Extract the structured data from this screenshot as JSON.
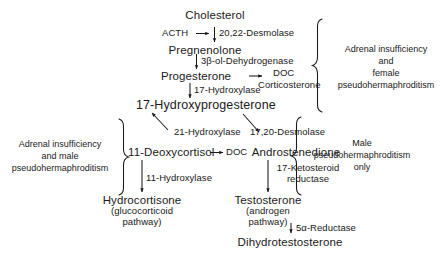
{
  "diagram": {
    "ink_color": "#1a1a1a",
    "background_color": "#ffffff"
  },
  "metabolites": {
    "cholesterol": "Cholesterol",
    "pregnenolone": "Pregnenolone",
    "progesterone": "Progesterone",
    "doc_upper": "DOC",
    "corticosterone": "Corticosterone",
    "hydroxyprogesterone": "17-Hydroxyprogesterone",
    "deoxycortisol": "11-Deoxycortisol",
    "doc_lower": "DOC",
    "androstenedione": "Androstenedione",
    "hydrocortisone": "Hydrocortisone",
    "hydrocortisone_sub1": "(glucocorticoid",
    "hydrocortisone_sub2": "pathway)",
    "testosterone": "Testosterone",
    "testosterone_sub1": "(androgen",
    "testosterone_sub2": "pathway)",
    "dihydrotestosterone": "Dihydrotestosterone"
  },
  "enzymes": {
    "desmolase_2022": "20,22-Desmolase",
    "dehydrogenase_3b": "3β-ol-Dehydrogenase",
    "hydroxylase_17": "17-Hydroxylase",
    "hydroxylase_21": "21-Hydroxylase",
    "desmolase_1720": "17,20-Desmolase",
    "hydroxylase_11": "11-Hydroxylase",
    "ketosteroid_reductase_1": "17-Ketosteroid",
    "ketosteroid_reductase_2": "reductase",
    "reductase_5a": "5α-Reductase"
  },
  "stimulus": {
    "acth": "ACTH"
  },
  "brackets": {
    "top_right": {
      "line1": "Adrenal insufficiency",
      "line2": "and",
      "line3": "female",
      "line4": "pseudohermaphroditism"
    },
    "left": {
      "line1": "Adrenal insufficiency",
      "line2": "and male",
      "line3": "pseudohermaphroditism"
    },
    "bottom_right": {
      "line1": "Male",
      "line2": "pseudohermaphroditism",
      "line3": "only"
    }
  }
}
